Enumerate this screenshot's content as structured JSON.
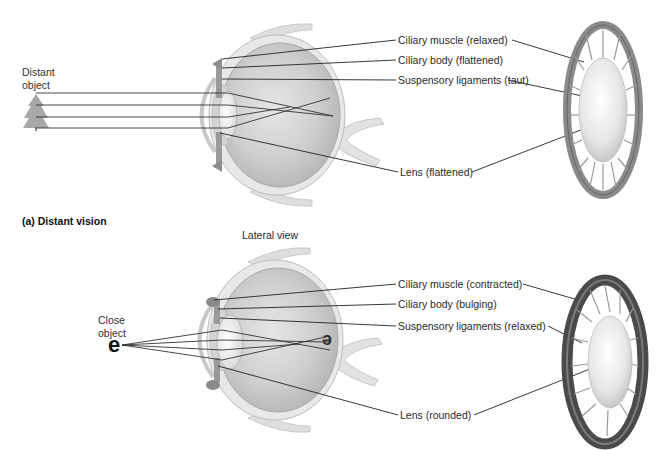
{
  "panel_a": {
    "object_label_line1": "Distant",
    "object_label_line2": "object",
    "labels": {
      "ciliary_muscle": "Ciliary muscle (relaxed)",
      "ciliary_body": "Ciliary body (flattened)",
      "suspensory": "Suspensory ligaments (taut)",
      "lens": "Lens (flattened)"
    },
    "caption": "(a) Distant vision"
  },
  "center_caption": "Lateral view",
  "panel_b": {
    "object_label_line1": "Close",
    "object_label_line2": "object",
    "object_glyph": "e",
    "image_glyph": "e",
    "labels": {
      "ciliary_muscle": "Ciliary muscle (contracted)",
      "ciliary_body": "Ciliary body (bulging)",
      "suspensory": "Suspensory ligaments (relaxed)",
      "lens": "Lens (rounded)"
    }
  },
  "colors": {
    "eyeball": "#c8c8c8",
    "sclera": "#e4e4e4",
    "lens": "#f2f2f2",
    "ring_dark": "#6a6a6a",
    "leader": "#222222"
  }
}
